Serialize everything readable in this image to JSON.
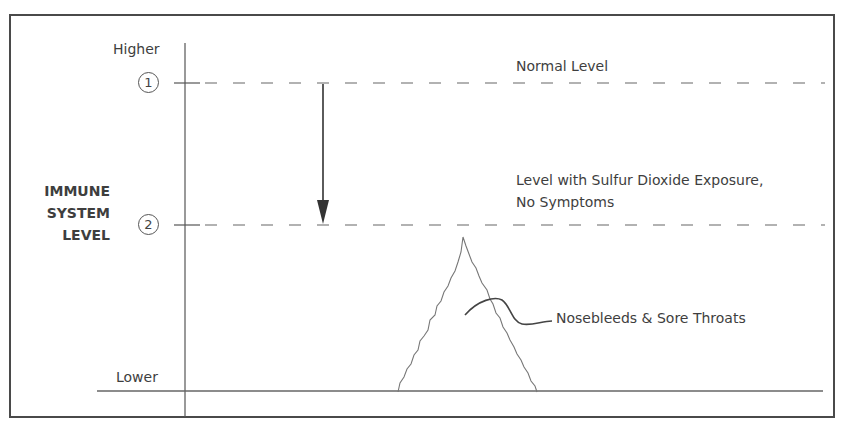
{
  "diagram": {
    "y_axis": {
      "title_lines": [
        "IMMUNE",
        "SYSTEM",
        "LEVEL"
      ],
      "top_label": "Higher",
      "bottom_label": "Lower"
    },
    "markers": [
      {
        "number": "1",
        "label": "Normal Level"
      },
      {
        "number": "2",
        "label_lines": [
          "Level with Sulfur Dioxide Exposure,",
          "No Symptoms"
        ]
      }
    ],
    "peak_annotation": "Nosebleeds & Sore Throats",
    "colors": {
      "line": "#555555",
      "text": "#3e3e3e",
      "border": "#444444"
    }
  }
}
